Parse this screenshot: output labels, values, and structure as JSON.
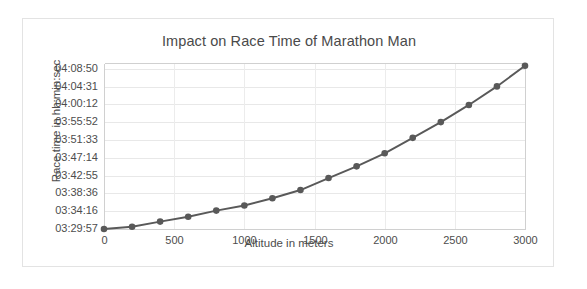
{
  "chart_data": {
    "type": "line",
    "title": "Impact on Race Time of Marathon Man",
    "xlabel": "Altitude in meters",
    "ylabel": "Race time in hh:min:sec",
    "grid": true,
    "legend": "none",
    "xlim": [
      0,
      3000
    ],
    "xticks": [
      0,
      500,
      1000,
      1500,
      2000,
      2500,
      3000
    ],
    "xtick_labels": [
      "0",
      "500",
      "1000",
      "1500",
      "2000",
      "2500",
      "3000"
    ],
    "ytick_labels": [
      "03:29:57",
      "03:34:16",
      "03:38:36",
      "03:42:55",
      "03:47:14",
      "03:51:33",
      "03:55:52",
      "04:00:12",
      "04:04:31",
      "04:08:50"
    ],
    "ytick_seconds": [
      12597,
      12856,
      13116,
      13375,
      13634,
      13893,
      14152,
      14412,
      14671,
      14930
    ],
    "ylim_seconds": [
      12597,
      15016
    ],
    "series": [
      {
        "name": "Race time",
        "color": "#595959",
        "marker": "circle",
        "x": [
          0,
          200,
          400,
          600,
          800,
          1000,
          1200,
          1400,
          1600,
          1800,
          2000,
          2200,
          2400,
          2600,
          2800,
          3000
        ],
        "y_labels": [
          "03:29:57",
          "03:30:30",
          "03:31:45",
          "03:32:55",
          "03:34:25",
          "03:35:40",
          "03:37:25",
          "03:39:25",
          "03:42:20",
          "03:45:10",
          "03:48:20",
          "03:52:05",
          "03:55:55",
          "04:00:05",
          "04:04:35",
          "04:09:35"
        ],
        "y_seconds": [
          12597,
          12630,
          12705,
          12775,
          12865,
          12940,
          13045,
          13165,
          13340,
          13510,
          13700,
          13925,
          14155,
          14405,
          14675,
          14975
        ]
      }
    ]
  }
}
